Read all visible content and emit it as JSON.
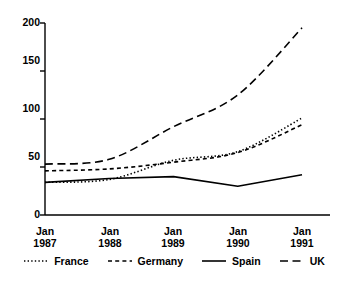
{
  "chart_data": {
    "type": "line",
    "title": "",
    "subtitle": "",
    "xlabel": "",
    "ylabel": "",
    "x": [
      "Jan 1987",
      "Jan 1988",
      "Jan 1989",
      "Jan 1990",
      "Jan 1991"
    ],
    "x_tick_lines": [
      {
        "line1": "Jan",
        "line2": "1987"
      },
      {
        "line1": "Jan",
        "line2": "1988"
      },
      {
        "line1": "Jan",
        "line2": "1989"
      },
      {
        "line1": "Jan",
        "line2": "1990"
      },
      {
        "line1": "Jan",
        "line2": "1991"
      }
    ],
    "y_ticks": [
      0,
      50,
      100,
      150,
      200
    ],
    "y_tick_labels": [
      "0",
      "50",
      "100",
      "150",
      "200"
    ],
    "ylim": [
      0,
      200
    ],
    "grid": false,
    "legend_position": "bottom",
    "series": [
      {
        "name": "France",
        "style": "dotted",
        "color": "#000000",
        "values": [
          34,
          37,
          57,
          66,
          101
        ]
      },
      {
        "name": "Germany",
        "style": "dashed",
        "color": "#000000",
        "values": [
          46,
          48,
          55,
          65,
          94
        ]
      },
      {
        "name": "Spain",
        "style": "solid",
        "color": "#000000",
        "values": [
          34,
          38,
          40,
          30,
          42
        ]
      },
      {
        "name": "UK",
        "style": "long-dash",
        "color": "#000000",
        "values": [
          53,
          58,
          92,
          125,
          195
        ]
      }
    ]
  },
  "legend": {
    "items": [
      {
        "label": "France"
      },
      {
        "label": "Germany"
      },
      {
        "label": "Spain"
      },
      {
        "label": "UK"
      }
    ]
  },
  "axes": {
    "y_labels": [
      "200",
      "150",
      "100",
      "50",
      "0"
    ],
    "x_labels_line1": [
      "Jan",
      "Jan",
      "Jan",
      "Jan",
      "Jan"
    ],
    "x_labels_line2": [
      "1987",
      "1988",
      "1989",
      "1990",
      "1991"
    ]
  }
}
